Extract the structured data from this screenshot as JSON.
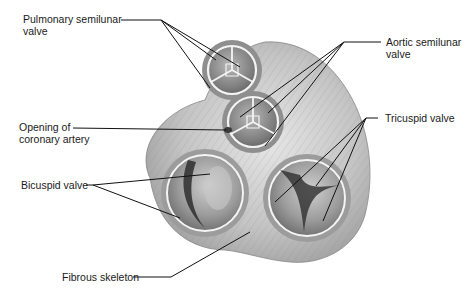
{
  "figure": {
    "colors": {
      "background": "#ffffff",
      "tissue_light": "#d9d9d9",
      "tissue_mid": "#a8a8a8",
      "tissue_dark": "#5a5a5a",
      "valve_rim": "#f2f2f2",
      "leader_line": "#111111",
      "text": "#1a1a1a"
    }
  },
  "labels": {
    "pulmonary": {
      "line1": "Pulmonary semilunar",
      "line2": "valve"
    },
    "aortic": {
      "line1": "Aortic semilunar",
      "line2": "valve"
    },
    "coronary": {
      "line1": "Opening of",
      "line2": "coronary artery"
    },
    "tricuspid": {
      "line1": "Tricuspid valve"
    },
    "bicuspid": {
      "line1": "Bicuspid valve"
    },
    "fibrous": {
      "line1": "Fibrous skeleton"
    }
  }
}
